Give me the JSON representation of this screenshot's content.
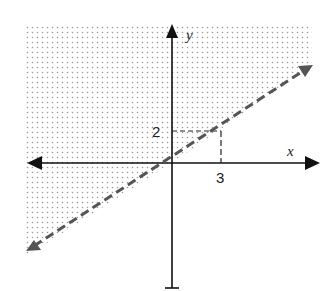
{
  "diagram": {
    "type": "linear inequality graph",
    "axes": {
      "x_label": "x",
      "y_label": "y"
    },
    "boundary_line": {
      "style": "dashed",
      "slope": "2/3",
      "through": [
        [
          0,
          0
        ],
        [
          3,
          2
        ]
      ]
    },
    "shaded_region": "above the line",
    "reference_point": {
      "x_label": "3",
      "y_label": "2"
    },
    "colors": {
      "axis": "#111111",
      "dashed_line": "#555555",
      "shade_dot": "#999999"
    }
  }
}
